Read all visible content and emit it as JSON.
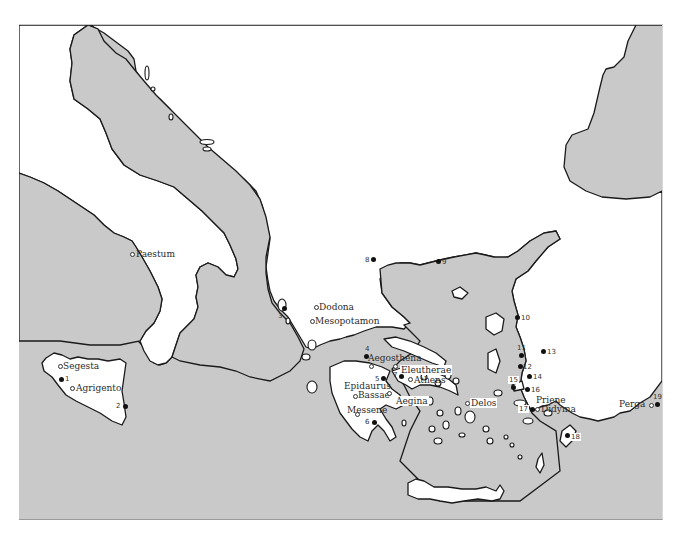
{
  "map": {
    "colors": {
      "sea": "#c9c9c9",
      "land": "#ffffff",
      "coastline": "#1a1a1a"
    },
    "named_sites": [
      {
        "id": "paestum",
        "label": "Paestum",
        "marker": "open"
      },
      {
        "id": "segesta",
        "label": "Segesta",
        "marker": "open"
      },
      {
        "id": "agrigento",
        "label": "Agrigento",
        "marker": "open"
      },
      {
        "id": "dodona",
        "label": "Dodona",
        "marker": "open"
      },
      {
        "id": "mesopotamon",
        "label": "Mesopotamon",
        "marker": "open"
      },
      {
        "id": "aegosthena",
        "label": "Aegosthena",
        "marker": "open"
      },
      {
        "id": "eleutherae",
        "label": "Eleutherae",
        "marker": "open"
      },
      {
        "id": "athens",
        "label": "Athens",
        "marker": "open"
      },
      {
        "id": "epidaurus",
        "label": "Epidaurus",
        "marker": "open"
      },
      {
        "id": "bassae",
        "label": "Bassae",
        "marker": "open"
      },
      {
        "id": "messene",
        "label": "Messene",
        "marker": "open"
      },
      {
        "id": "aegina",
        "label": "Aegina",
        "marker": "open"
      },
      {
        "id": "delos",
        "label": "Delos",
        "marker": "open"
      },
      {
        "id": "priene",
        "label": "Priene",
        "marker": "open"
      },
      {
        "id": "didyma",
        "label": "Didyma",
        "marker": "open"
      },
      {
        "id": "perga",
        "label": "Perga",
        "marker": "open"
      }
    ],
    "numbered_sites": [
      "1",
      "2",
      "3",
      "4",
      "5",
      "6",
      "7",
      "8",
      "9",
      "10",
      "11",
      "12",
      "13",
      "14",
      "15",
      "16",
      "17",
      "18",
      "19"
    ]
  }
}
